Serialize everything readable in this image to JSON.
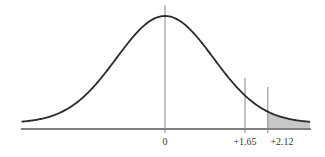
{
  "chart_data": {
    "type": "area",
    "title": "",
    "distribution": "standard normal",
    "mean": 0,
    "sd": 1,
    "x_range": [
      -3,
      3
    ],
    "xlabel": "",
    "ylabel": "",
    "markers": [
      {
        "z": 0,
        "label": "0"
      },
      {
        "z": 1.65,
        "label": "+1.65"
      },
      {
        "z": 2.12,
        "label": "+2.12"
      }
    ],
    "shaded_region": {
      "from": 2.12,
      "to": 3.0,
      "color": "#c8c8c8"
    },
    "grid": false,
    "legend": false
  },
  "colors": {
    "curve": "#2a2a2a",
    "axis": "#555555",
    "marker": "#888888",
    "shade": "#c8c8c8"
  },
  "labels": {
    "zero": "0",
    "z165": "+1.65",
    "z212": "+2.12"
  }
}
